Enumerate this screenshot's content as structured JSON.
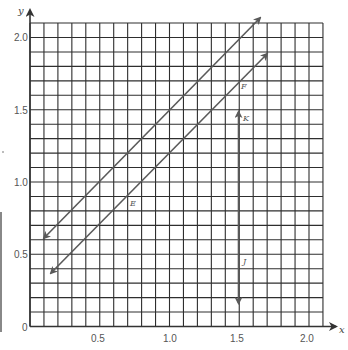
{
  "chart_data": {
    "type": "line",
    "title": "",
    "xlabel": "x",
    "ylabel": "y",
    "xlim": [
      0,
      2.1
    ],
    "ylim": [
      0,
      2.1
    ],
    "grid": true,
    "grid_step": 0.1,
    "x_ticks": [
      "0.5",
      "1.0",
      "1.5",
      "2.0"
    ],
    "y_ticks": [
      "0.5",
      "1.0",
      "1.5",
      "2.0"
    ],
    "origin_label": "0",
    "series": [
      {
        "name": "upper-line",
        "label": "",
        "points": [
          [
            0.1,
            0.61
          ],
          [
            1.65,
            2.13
          ]
        ],
        "arrows": "both"
      },
      {
        "name": "lower-line",
        "labels": [
          "E",
          "F"
        ],
        "points": [
          [
            0.15,
            0.37
          ],
          [
            1.7,
            1.88
          ]
        ],
        "arrows": "both"
      },
      {
        "name": "vertical-line",
        "labels": [
          "K",
          "J"
        ],
        "points": [
          [
            1.5,
            1.48
          ],
          [
            1.5,
            0.16
          ]
        ],
        "arrows": "both"
      }
    ],
    "annotations": [
      {
        "text": "E",
        "x": 0.73,
        "y": 0.85
      },
      {
        "text": "F",
        "x": 1.53,
        "y": 1.66
      },
      {
        "text": "K",
        "x": 1.55,
        "y": 1.45
      },
      {
        "text": "J",
        "x": 1.54,
        "y": 0.45
      }
    ]
  },
  "labels": {
    "x_axis": "x",
    "y_axis": "y",
    "origin": "0",
    "x_ticks": [
      "0.5",
      "1.0",
      "1.5",
      "2.0"
    ],
    "y_ticks": [
      "0.5",
      "1.0",
      "1.5",
      "2.0"
    ],
    "E": "E",
    "F": "F",
    "K": "K",
    "J": "J"
  },
  "colors": {
    "grid": "#2e2e2e",
    "lines": "#5a5a5a",
    "text": "#555555"
  }
}
